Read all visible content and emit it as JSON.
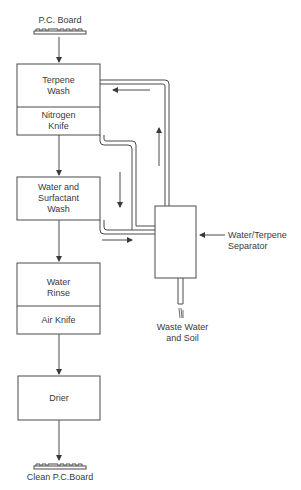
{
  "diagram": {
    "type": "process-flow",
    "input": "P.C. Board",
    "output": "Clean P.C.Board",
    "stages": [
      {
        "id": "terpene-wash",
        "lines": [
          "Terpene",
          "Wash"
        ],
        "sub": [
          "Nitrogen",
          "Knife"
        ]
      },
      {
        "id": "water-surfactant-wash",
        "lines": [
          "Water and",
          "Surfactant",
          "Wash"
        ]
      },
      {
        "id": "water-rinse",
        "lines": [
          "Water",
          "Rinse"
        ],
        "sub": [
          "Air Knife"
        ]
      },
      {
        "id": "drier",
        "lines": [
          "Drier"
        ]
      }
    ],
    "separator": {
      "lines": [
        "Water/Terpene",
        "Separator"
      ]
    },
    "waste": {
      "lines": [
        "Waste Water",
        "and Soil"
      ]
    }
  },
  "colors": {
    "line": "#4a4a4a",
    "background": "#ffffff"
  }
}
